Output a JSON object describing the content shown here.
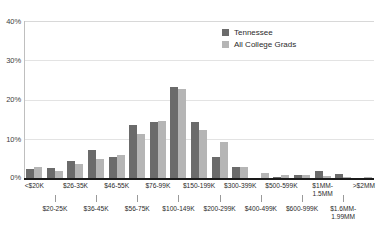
{
  "chart_data": {
    "type": "bar",
    "title": "",
    "subtitle": "",
    "xlabel": "",
    "ylabel": "",
    "ylim": [
      0,
      40
    ],
    "yticks": [
      "0%",
      "10%",
      "20%",
      "30%",
      "40%"
    ],
    "ytick_values": [
      0,
      10,
      20,
      30,
      40
    ],
    "grid": true,
    "legend_position": "top-right",
    "categories": [
      "<$20K",
      "$20-25K",
      "$26-35K",
      "$36-45K",
      "$46-55K",
      "$56-75K",
      "$76-99K",
      "$100-149K",
      "$150-199K",
      "$200-299K",
      "$300-399K",
      "$400-499K",
      "$500-599K",
      "$600-999K",
      "$1MM-1.5MM",
      "$1.6MM-1.99MM",
      ">$2MM"
    ],
    "series": [
      {
        "name": "Tennessee",
        "color": "#6b6b6b",
        "values": [
          2.4,
          2.5,
          4.3,
          7.2,
          5.3,
          13.4,
          14.2,
          23.2,
          14.3,
          5.4,
          2.7,
          0.1,
          0.2,
          0.8,
          1.8,
          1.0,
          0.0
        ]
      },
      {
        "name": "All College Grads",
        "color": "#b5b5b5",
        "values": [
          2.8,
          1.8,
          3.6,
          4.9,
          5.9,
          11.1,
          14.4,
          22.8,
          12.2,
          9.3,
          2.8,
          1.2,
          0.8,
          0.8,
          0.5,
          0.2,
          0.3
        ]
      }
    ]
  },
  "axis": {
    "y_ticks": [
      {
        "label": "40%",
        "value": 40
      },
      {
        "label": "30%",
        "value": 30
      },
      {
        "label": "20%",
        "value": 20
      },
      {
        "label": "10%",
        "value": 10
      },
      {
        "label": "0%",
        "value": 0
      }
    ],
    "x_labels_top": [
      "<$20K",
      "$26-35K",
      "$46-55K",
      "$76-99K",
      "$150-199K",
      "$300-399K",
      "$500-599K",
      "$1MM-1.5MM",
      ">$2MM"
    ],
    "x_labels_bottom": [
      "$20-25K",
      "$36-45K",
      "$56-75K",
      "$100-149K",
      "$200-299K",
      "$400-499K",
      "$600-999K",
      "$1.6MM-1.99MM"
    ]
  },
  "legend": {
    "items": [
      {
        "label": "Tennessee",
        "color": "#6b6b6b"
      },
      {
        "label": "All College Grads",
        "color": "#b5b5b5"
      }
    ]
  },
  "colors": {
    "series_0": "#6b6b6b",
    "series_1": "#b5b5b5",
    "gridline": "#e3e3e3",
    "axis": "#1a1a1a",
    "text": "#2b2b2b",
    "background": "#ffffff"
  }
}
